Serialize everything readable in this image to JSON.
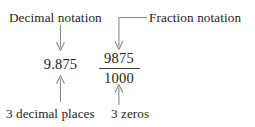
{
  "figure": {
    "background_color": "#ffffff",
    "text_color": "#232323",
    "line_color": "#7a7a7a"
  },
  "labels": {
    "decimal_notation": "Decimal notation",
    "fraction_notation": "Fraction notation",
    "decimal_places": "3 decimal places",
    "zeros": "3 zeros"
  },
  "decimal": {
    "value": "9.875"
  },
  "fraction": {
    "numerator": "9875",
    "denominator": "1000"
  },
  "connectors": {
    "decimal_down_arrow": "down-arrow-icon",
    "fraction_elbow_down_arrow": "elbow-down-arrow-icon",
    "decimal_places_up_arrow": "up-arrow-icon",
    "zeros_up_arrow": "up-arrow-icon"
  }
}
